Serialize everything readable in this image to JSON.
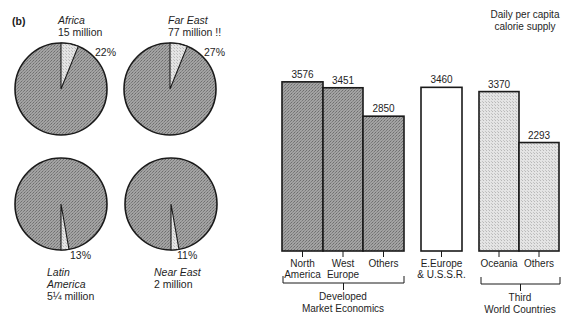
{
  "panel_label": "(b)",
  "colors": {
    "dark_fill": "#9a9a9a",
    "light_fill": "#dcdcdc",
    "white_fill": "#ffffff",
    "stroke": "#1a1a1a"
  },
  "pies": [
    {
      "name": "Africa",
      "region": "Africa",
      "amount": "15 million",
      "percent": "22%",
      "cx": 61,
      "cy": 89,
      "r": 46,
      "wedge_start": 0,
      "wedge_end": 22,
      "label_x": 95,
      "label_y": 56,
      "title_x": 60,
      "title_y": 24,
      "title_lines": [
        "Africa",
        "15 million"
      ],
      "title_pos": "top"
    },
    {
      "name": "Far East",
      "region": "Far East",
      "amount": "77 million !!",
      "percent": "27%",
      "cx": 170,
      "cy": 89,
      "r": 46,
      "wedge_start": 0,
      "wedge_end": 22,
      "label_x": 204,
      "label_y": 56,
      "title_x": 170,
      "title_y": 24,
      "title_lines": [
        "Far East",
        "77 million !!"
      ],
      "title_pos": "top"
    },
    {
      "name": "Latin America",
      "region": "Latin America",
      "amount": "5¼ million",
      "percent": "13%",
      "cx": 61,
      "cy": 204,
      "r": 46,
      "wedge_start": 170,
      "wedge_end": 180,
      "label_x": 70,
      "label_y": 259,
      "title_x": 47,
      "title_y": 276,
      "title_lines": [
        "Latin",
        "America",
        "5¼ million"
      ],
      "title_pos": "bottom"
    },
    {
      "name": "Near East",
      "region": "Near East",
      "amount": "2 million",
      "percent": "11%",
      "cx": 171,
      "cy": 204,
      "r": 46,
      "wedge_start": 170,
      "wedge_end": 180,
      "label_x": 177,
      "label_y": 259,
      "title_x": 154,
      "title_y": 276,
      "title_lines": [
        "Near East",
        "2 million"
      ],
      "title_pos": "bottom"
    }
  ],
  "chart_data": [
    {
      "type": "pie",
      "title": "(b)",
      "pies": [
        {
          "label": "Africa",
          "subtitle": "15 million",
          "highlighted_percent": 22
        },
        {
          "label": "Far East",
          "subtitle": "77 million !!",
          "highlighted_percent": 27
        },
        {
          "label": "Latin America",
          "subtitle": "5¼ million",
          "highlighted_percent": 13
        },
        {
          "label": "Near East",
          "subtitle": "2 million",
          "highlighted_percent": 11
        }
      ]
    },
    {
      "type": "bar",
      "title": "Daily per capita calorie supply",
      "categories": [
        "North America",
        "West Europe",
        "Others",
        "E.Europe & U.S.S.R.",
        "Oceania",
        "Others"
      ],
      "values": [
        3576,
        3451,
        2850,
        3460,
        3370,
        2293
      ],
      "groups": [
        {
          "name": "Developed Market Economics",
          "categories": [
            "North America",
            "West Europe",
            "Others"
          ],
          "values": [
            3576,
            3451,
            2850
          ]
        },
        {
          "name": "E.Europe & U.S.S.R.",
          "categories": [
            "E.Europe & U.S.S.R."
          ],
          "values": [
            3460
          ]
        },
        {
          "name": "Third World Countries",
          "categories": [
            "Oceania",
            "Others"
          ],
          "values": [
            3370,
            2293
          ]
        }
      ],
      "xlabel": "",
      "ylabel": "",
      "grid": false,
      "legend": "none"
    }
  ],
  "bar_chart": {
    "title_lines": [
      "Daily per capita",
      "calorie supply"
    ],
    "title_x": 485,
    "title_y": 18,
    "baseline_y": 251,
    "scale_px_per_unit": 0.04754,
    "bars": [
      {
        "label_lines": [
          "North",
          "America"
        ],
        "value": "3576",
        "num": 3576,
        "x": 282,
        "w": 41,
        "fill": "dark"
      },
      {
        "label_lines": [
          "West",
          "Europe"
        ],
        "value": "3451",
        "num": 3451,
        "x": 323,
        "w": 40,
        "fill": "dark"
      },
      {
        "label_lines": [
          "Others"
        ],
        "value": "2850",
        "num": 2850,
        "x": 363,
        "w": 41,
        "fill": "dark"
      },
      {
        "label_lines": [
          "E.Europe",
          "& U.S.S.R."
        ],
        "value": "3460",
        "num": 3460,
        "x": 421,
        "w": 41,
        "fill": "white"
      },
      {
        "label_lines": [
          "Oceania"
        ],
        "value": "3370",
        "num": 3370,
        "x": 479,
        "w": 40,
        "fill": "light"
      },
      {
        "label_lines": [
          "Others"
        ],
        "value": "2293",
        "num": 2293,
        "x": 519,
        "w": 40,
        "fill": "light"
      }
    ],
    "brackets": [
      {
        "x1": 283,
        "x2": 404,
        "y": 283,
        "label_lines": [
          "Developed",
          "Market  Economics"
        ],
        "label_x": 343
      },
      {
        "x1": 481,
        "x2": 560,
        "y": 284,
        "label_lines": [
          "Third",
          "World  Countries"
        ],
        "label_x": 520
      }
    ]
  }
}
